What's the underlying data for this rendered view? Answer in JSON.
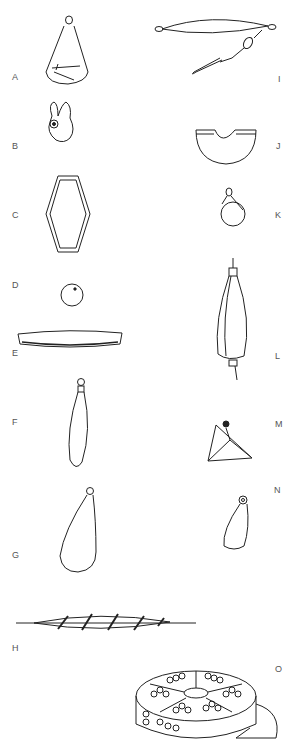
{
  "figure": {
    "items": [
      {
        "letter": "A",
        "shape": "cone sinker with slot"
      },
      {
        "letter": "B",
        "shape": "split-shot with ears"
      },
      {
        "letter": "C",
        "shape": "hexagonal flat lead"
      },
      {
        "letter": "D",
        "shape": "ball / round shot"
      },
      {
        "letter": "E",
        "shape": "barrel / olive sinker"
      },
      {
        "letter": "F",
        "shape": "elongated pear with swivel"
      },
      {
        "letter": "G",
        "shape": "large pear / bomb"
      },
      {
        "letter": "H",
        "shape": "spiral (Wye) lead"
      },
      {
        "letter": "I",
        "shape": "jig weight with swivel and clip"
      },
      {
        "letter": "J",
        "shape": "half-moon"
      },
      {
        "letter": "K",
        "shape": "round sinker with wire loop"
      },
      {
        "letter": "L",
        "shape": "teardrop tube / drilled bullet"
      },
      {
        "letter": "M",
        "shape": "pyramid"
      },
      {
        "letter": "N",
        "shape": "small pear with eye"
      },
      {
        "letter": "O",
        "shape": "split-shot dispenser"
      }
    ]
  },
  "labels": {
    "A": "A",
    "B": "B",
    "C": "C",
    "D": "D",
    "E": "E",
    "F": "F",
    "G": "G",
    "H": "H",
    "I": "I",
    "J": "J",
    "K": "K",
    "L": "L",
    "M": "M",
    "N": "N",
    "O": "O"
  },
  "colors": {
    "ink": "#222222",
    "label": "#555555",
    "background": "#ffffff"
  }
}
